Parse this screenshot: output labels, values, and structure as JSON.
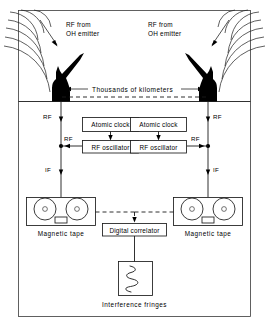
{
  "figure": {
    "name": "vlbi-interferometry-diagram",
    "sky": {
      "left_source_label_line1": "RF from",
      "left_source_label_line2": "OH emitter",
      "right_source_label_line1": "RF from",
      "right_source_label_line2": "OH emitter",
      "baseline_label": "Thousands of kilometers"
    },
    "left_station": {
      "rf_top_label": "RF",
      "rf_mid_label": "RF",
      "if_label": "IF",
      "atomic_clock_label": "Atomic clock",
      "rf_oscillator_label": "RF oscillator",
      "tape_label": "Magnetic tape"
    },
    "right_station": {
      "rf_top_label": "RF",
      "rf_mid_label": "RF",
      "if_label": "IF",
      "atomic_clock_label": "Atomic clock",
      "rf_oscillator_label": "RF oscillator",
      "tape_label": "Magnetic tape"
    },
    "processing": {
      "correlator_label": "Digital correlator",
      "fringes_label": "Interference fringes"
    },
    "colors": {
      "ink": "#1a1a1a",
      "frame": "#3a3a3a",
      "background": "#ffffff",
      "silhouette": "#000000"
    }
  }
}
